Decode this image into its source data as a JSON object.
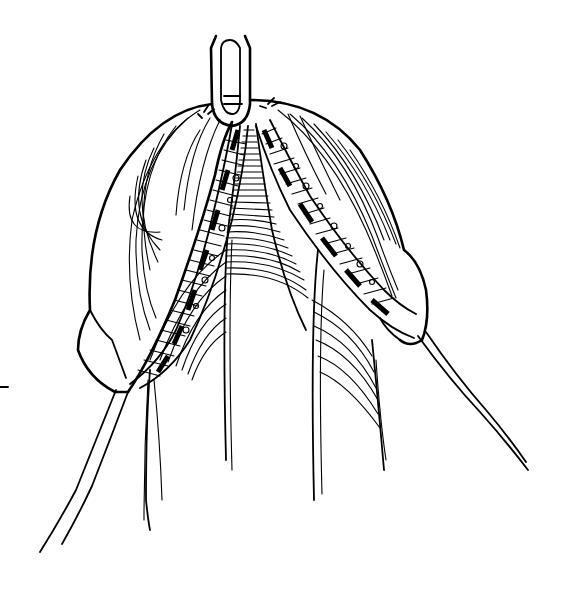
{
  "illustration": {
    "width": 567,
    "height": 595,
    "background": "#ffffff",
    "ink_color": "#000000"
  }
}
